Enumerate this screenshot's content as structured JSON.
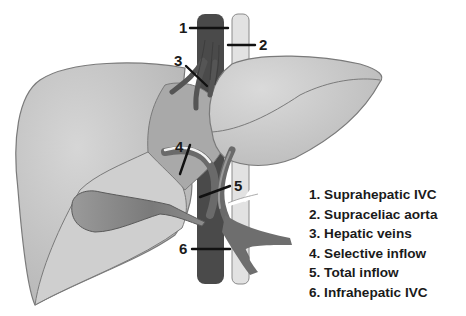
{
  "diagram": {
    "colors": {
      "liver_light": "#c8c8c8",
      "liver_mid": "#b4b4b4",
      "liver_outline": "#7a7a7a",
      "ivc": "#4a4a4a",
      "aorta": "#e2e2e2",
      "vessel_dark": "#5e5e5e",
      "gallbladder": "#8a8a8a",
      "clamp_line": "#111111"
    },
    "markers": [
      {
        "id": "1",
        "label": "1"
      },
      {
        "id": "2",
        "label": "2"
      },
      {
        "id": "3",
        "label": "3"
      },
      {
        "id": "4",
        "label": "4"
      },
      {
        "id": "5",
        "label": "5"
      },
      {
        "id": "6",
        "label": "6"
      }
    ],
    "legend": [
      "1. Suprahepatic IVC",
      "2. Supraceliac aorta",
      "3. Hepatic veins",
      "4. Selective inflow",
      "5. Total inflow",
      "6. Infrahepatic IVC"
    ]
  }
}
